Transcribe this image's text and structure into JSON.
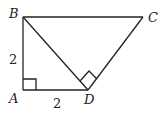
{
  "diagram": {
    "points": {
      "A": "A",
      "B": "B",
      "C": "C",
      "D": "D"
    },
    "labels": {
      "AB": "2",
      "AD": "2"
    },
    "stroke_color": "#222222"
  }
}
